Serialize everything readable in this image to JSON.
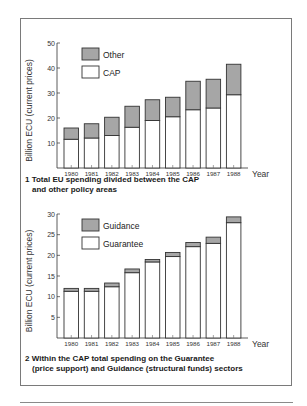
{
  "chart_data": [
    {
      "type": "bar",
      "stacked": true,
      "title": "1 Total EU spending divided between the CAP and other policy areas",
      "caption_lines": [
        "1 Total EU spending divided between the CAP",
        "and other policy areas"
      ],
      "xlabel": "Year",
      "ylabel": "Billion ECU (current prices)",
      "ylim": [
        0,
        50
      ],
      "yticks": [
        10,
        20,
        30,
        40,
        50
      ],
      "categories": [
        "1980",
        "1981",
        "1982",
        "1983",
        "1984",
        "1985",
        "1986",
        "1987",
        "1988"
      ],
      "series": [
        {
          "name": "CAP",
          "color": "#ffffff",
          "values": [
            11.5,
            12,
            13,
            16.3,
            19,
            20.5,
            23.3,
            24,
            29.3
          ]
        },
        {
          "name": "Other",
          "color": "#a6a6a6",
          "values": [
            4.5,
            5.7,
            7.3,
            8.4,
            8.3,
            7.8,
            11.4,
            11.5,
            12.2
          ]
        }
      ],
      "totals": [
        16,
        17.7,
        20.3,
        24.7,
        27.3,
        28.3,
        34.7,
        35.5,
        41.5
      ],
      "legend": [
        {
          "label": "Other",
          "color": "#a6a6a6"
        },
        {
          "label": "CAP",
          "color": "#ffffff"
        }
      ],
      "legend_position": "top-left",
      "grid": false
    },
    {
      "type": "bar",
      "stacked": true,
      "title": "2 Within the CAP total spending on the Guarantee (price support) and Guidance (structural funds) sectors",
      "caption_lines": [
        "2 Within the CAP total spending on the Guarantee",
        "(price support) and Guidance (structural funds) sectors"
      ],
      "xlabel": "Year",
      "ylabel": "Billion ECU (current prices)",
      "ylim": [
        0,
        30
      ],
      "yticks": [
        5,
        10,
        15,
        20,
        25,
        30
      ],
      "categories": [
        "1980",
        "1981",
        "1982",
        "1983",
        "1984",
        "1985",
        "1986",
        "1987",
        "1988"
      ],
      "series": [
        {
          "name": "Guarantee",
          "color": "#ffffff",
          "values": [
            11.3,
            11.3,
            12.4,
            15.8,
            18.4,
            19.7,
            22.1,
            22.9,
            27.9
          ]
        },
        {
          "name": "Guidance",
          "color": "#a6a6a6",
          "values": [
            0.7,
            0.7,
            0.9,
            0.9,
            0.6,
            1.0,
            1.0,
            1.5,
            1.4
          ]
        }
      ],
      "totals": [
        12,
        12,
        13.3,
        16.7,
        19,
        20.7,
        23.1,
        24.4,
        29.3
      ],
      "legend": [
        {
          "label": "Guidance",
          "color": "#a6a6a6"
        },
        {
          "label": "Guarantee",
          "color": "#ffffff"
        }
      ],
      "legend_position": "top-left",
      "grid": false
    }
  ]
}
